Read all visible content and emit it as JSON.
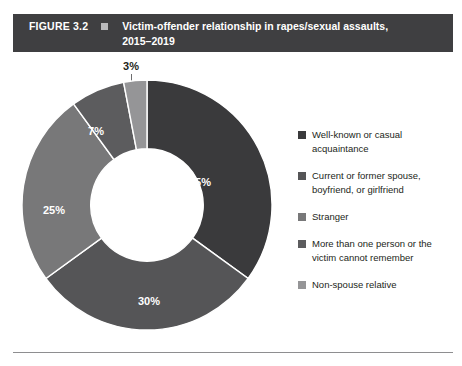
{
  "figure": {
    "number": "FIGURE 3.2",
    "title_line1": "Victim-offender relationship in rapes/sexual assaults,",
    "title_line2": "2015–2019",
    "header_bg": "#3f3f41",
    "header_bullet_color": "#b9b9bb"
  },
  "chart_data": {
    "type": "pie",
    "variant": "donut",
    "xlabel": "",
    "ylabel": "",
    "units": "percent",
    "start_angle_deg": 0,
    "direction": "clockwise",
    "inner_radius_ratio": 0.45,
    "categories": [
      "Well-known or casual acquaintance",
      "Current or former spouse, boyfriend, or girlfriend",
      "Stranger",
      "More than one person or the victim cannot remember",
      "Non-spouse relative"
    ],
    "values": [
      35,
      30,
      25,
      7,
      3
    ],
    "labels": [
      "35%",
      "30%",
      "25%",
      "7%",
      "3%"
    ],
    "colors": [
      "#3a3a3c",
      "#555557",
      "#787879",
      "#5c5c5e",
      "#959597"
    ],
    "legend_position": "right",
    "grid": false
  },
  "slices": [
    {
      "label": "35%",
      "value": 35,
      "color": "#3a3a3c",
      "label_x": 178,
      "label_y": 103,
      "label_placement": "inside"
    },
    {
      "label": "30%",
      "value": 30,
      "color": "#555557",
      "label_x": 127,
      "label_y": 222,
      "label_placement": "inside"
    },
    {
      "label": "25%",
      "value": 25,
      "color": "#787879",
      "label_x": 32,
      "label_y": 131,
      "label_placement": "inside"
    },
    {
      "label": "7%",
      "value": 7,
      "color": "#5c5c5e",
      "label_x": 74,
      "label_y": 52,
      "label_placement": "inside"
    },
    {
      "label": "3%",
      "value": 3,
      "color": "#959597",
      "label_placement": "callout"
    }
  ],
  "callout": {
    "text": "3%"
  },
  "legend": {
    "items": [
      {
        "label": "Well-known or casual acquaintance",
        "color": "#3a3a3c"
      },
      {
        "label": "Current or former spouse, boyfriend, or girlfriend",
        "color": "#555557"
      },
      {
        "label": "Stranger",
        "color": "#787879"
      },
      {
        "label": "More than one person or the victim cannot remember",
        "color": "#5c5c5e"
      },
      {
        "label": "Non-spouse relative",
        "color": "#959597"
      }
    ]
  }
}
